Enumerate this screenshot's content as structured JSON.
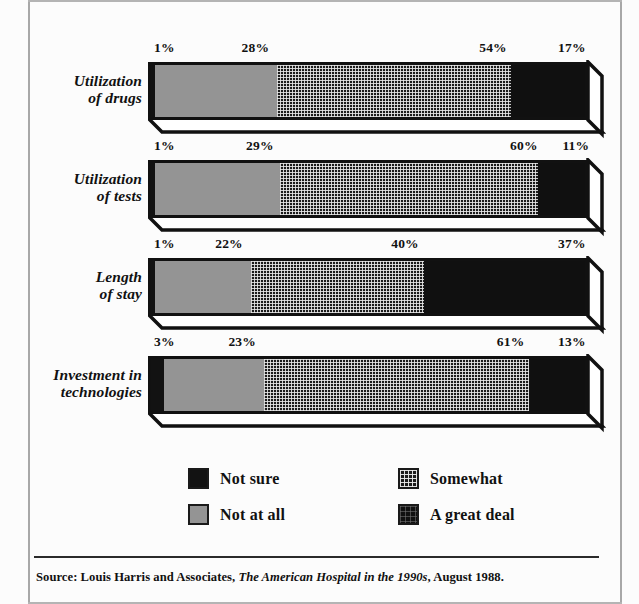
{
  "chart_data": {
    "type": "bar",
    "subtype": "stacked-horizontal-3d",
    "title": "",
    "xlabel": "",
    "ylabel": "",
    "xlim": [
      0,
      100
    ],
    "grid": false,
    "legend_position": "bottom",
    "stack_order": [
      "Not sure",
      "Not at all",
      "Somewhat",
      "A great deal"
    ],
    "categories": [
      "Utilization of drugs",
      "Utilization of tests",
      "Length of stay",
      "Investment in technologies"
    ],
    "series": [
      {
        "name": "Not sure",
        "values": [
          1,
          1,
          1,
          3
        ]
      },
      {
        "name": "Not at all",
        "values": [
          28,
          29,
          22,
          23
        ]
      },
      {
        "name": "Somewhat",
        "values": [
          54,
          60,
          40,
          61
        ]
      },
      {
        "name": "A great deal",
        "values": [
          17,
          11,
          37,
          13
        ]
      }
    ],
    "data_labels": [
      [
        "1%",
        "28%",
        "54%",
        "17%"
      ],
      [
        "1%",
        "29%",
        "60%",
        "11%"
      ],
      [
        "1%",
        "22%",
        "40%",
        "37%"
      ],
      [
        "3%",
        "23%",
        "61%",
        "13%"
      ]
    ]
  },
  "rows": [
    {
      "label_line1": "Utilization",
      "label_line2": "of drugs",
      "labels": {
        "notsure": "1%",
        "notatall": "28%",
        "somewhat": "54%",
        "greatdeal": "17%"
      },
      "values": {
        "notsure": 1,
        "notatall": 28,
        "somewhat": 54,
        "greatdeal": 17
      }
    },
    {
      "label_line1": "Utilization",
      "label_line2": "of tests",
      "labels": {
        "notsure": "1%",
        "notatall": "29%",
        "somewhat": "60%",
        "greatdeal": "11%"
      },
      "values": {
        "notsure": 1,
        "notatall": 29,
        "somewhat": 60,
        "greatdeal": 11
      }
    },
    {
      "label_line1": "Length",
      "label_line2": "of stay",
      "labels": {
        "notsure": "1%",
        "notatall": "22%",
        "somewhat": "40%",
        "greatdeal": "37%"
      },
      "values": {
        "notsure": 1,
        "notatall": 22,
        "somewhat": 40,
        "greatdeal": 37
      }
    },
    {
      "label_line1": "Investment in",
      "label_line2": "technologies",
      "labels": {
        "notsure": "3%",
        "notatall": "23%",
        "somewhat": "61%",
        "greatdeal": "13%"
      },
      "values": {
        "notsure": 3,
        "notatall": 23,
        "somewhat": 61,
        "greatdeal": 13
      }
    }
  ],
  "legend": {
    "items": [
      {
        "label": "Not sure",
        "swatch": "solid-black",
        "color": "#121212"
      },
      {
        "label": "Somewhat",
        "swatch": "dotted-grid",
        "color": "#1b1b1b"
      },
      {
        "label": "Not at all",
        "swatch": "solid-gray",
        "color": "#949494"
      },
      {
        "label": "A great deal",
        "swatch": "dark-textured",
        "color": "#101010"
      }
    ]
  },
  "source": {
    "prefix": "Source: Louis Harris and Associates, ",
    "italic": "The American Hospital in the 1990s",
    "suffix": ", August 1988."
  },
  "colors": {
    "ink": "#111111",
    "gray_fill": "#949494",
    "frame_rule": "#a8a8a8",
    "background": "#fcfcfc"
  }
}
